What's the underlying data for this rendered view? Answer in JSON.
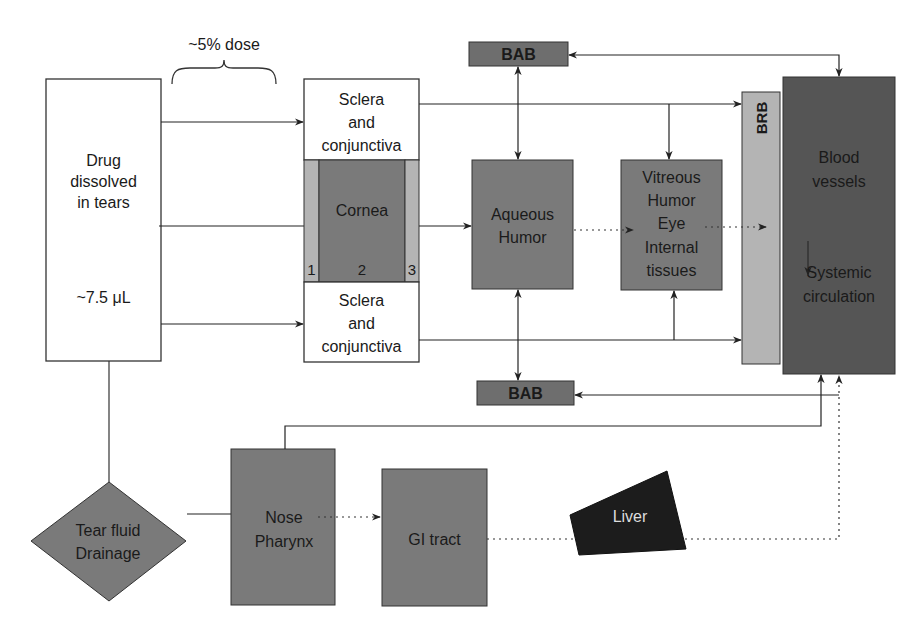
{
  "diagram": {
    "dose_label": "~5% dose",
    "drug_box": {
      "line1": "Drug",
      "line2": "dissolved",
      "line3": "in tears",
      "volume": "~7.5 μL"
    },
    "sclera_top": {
      "line1": "Sclera",
      "line2": "and",
      "line3": "conjunctiva"
    },
    "sclera_bottom": {
      "line1": "Sclera",
      "line2": "and",
      "line3": "conjunctiva"
    },
    "cornea": {
      "label": "Cornea",
      "layer1": "1",
      "layer2": "2",
      "layer3": "3"
    },
    "aqueous": {
      "line1": "Aqueous",
      "line2": "Humor"
    },
    "vitreous": {
      "line1": "Vitreous",
      "line2": "Humor",
      "line3": "Eye",
      "line4": "Internal",
      "line5": "tissues"
    },
    "bab_top": "BAB",
    "bab_bottom": "BAB",
    "brb": "BRB",
    "blood": {
      "line1": "Blood",
      "line2": "vessels",
      "line3": "Systemic",
      "line4": "circulation"
    },
    "tear_drainage": {
      "line1": "Tear fluid",
      "line2": "Drainage"
    },
    "nose": {
      "line1": "Nose",
      "line2": "Pharynx"
    },
    "gi": "GI tract",
    "liver": "Liver",
    "colors": {
      "white_box": "#ffffff",
      "mid_gray": "#7a7a7a",
      "light_gray": "#b4b4b4",
      "dark_gray": "#555555",
      "liver_black": "#1c1c1c",
      "line": "#2a2a2a"
    }
  }
}
